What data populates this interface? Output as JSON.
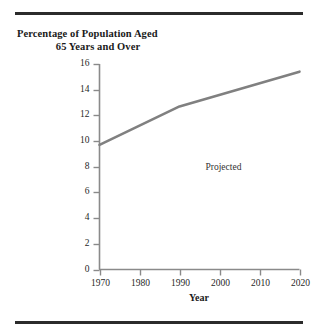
{
  "figure": {
    "title_line1": "Percentage of Population Aged",
    "title_line2": "65 Years and Over",
    "rule_color": "#2b2b2b",
    "background": "#ffffff"
  },
  "chart_data": {
    "type": "line",
    "title": "Percentage of Population Aged 65 Years and Over",
    "xlabel": "Year",
    "ylabel": "",
    "xlim": [
      1970,
      2020
    ],
    "ylim": [
      0,
      16
    ],
    "grid": false,
    "legend": "none",
    "line_color": "#808080",
    "axis_color": "#8a8a8a",
    "x": [
      1970,
      1990,
      2020
    ],
    "values": [
      9.7,
      12.7,
      15.4
    ],
    "series": [
      {
        "name": "Percentage of population aged 65 and over",
        "x": [
          1970,
          1990,
          2020
        ],
        "values": [
          9.7,
          12.7,
          15.4
        ]
      }
    ],
    "xticks": [
      1970,
      1980,
      1990,
      2000,
      2010,
      2020
    ],
    "xtick_labels": [
      "1970",
      "1980",
      "1990",
      "2000",
      "2010",
      "2020"
    ],
    "yticks": [
      0,
      2,
      4,
      6,
      8,
      10,
      12,
      14,
      16
    ],
    "ytick_labels": [
      "0",
      "2",
      "4",
      "6",
      "8",
      "10",
      "12",
      "14",
      "16"
    ],
    "annotations": [
      {
        "text": "Projected",
        "x": 2003,
        "y": 7.8
      }
    ]
  }
}
